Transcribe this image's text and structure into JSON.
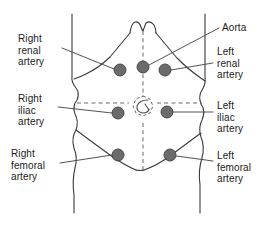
{
  "diagram": {
    "colors": {
      "outline": "#3a3a3a",
      "dot_fill": "#6b6b6b",
      "dot_stroke": "#3f3f3f",
      "leader_line": "#4a4a4a",
      "dashed_guide": "#6a6a6a",
      "text": "#1a1a1a",
      "background": "#ffffff"
    },
    "labels": [
      {
        "id": "right-renal-artery",
        "text": "Right\nrenal\nartery",
        "side": "left",
        "x": 18,
        "y": 33
      },
      {
        "id": "right-iliac-artery",
        "text": "Right\niliac\nartery",
        "side": "left",
        "x": 18,
        "y": 93
      },
      {
        "id": "right-femoral-artery",
        "text": "Right\nfemoral\nartery",
        "side": "left",
        "x": 11,
        "y": 148
      },
      {
        "id": "aorta",
        "text": "Aorta",
        "side": "right",
        "x": 222,
        "y": 22
      },
      {
        "id": "left-renal-artery",
        "text": "Left\nrenal\nartery",
        "side": "right",
        "x": 217,
        "y": 46
      },
      {
        "id": "left-iliac-artery",
        "text": "Left\niliac\nartery",
        "side": "right",
        "x": 217,
        "y": 100
      },
      {
        "id": "left-femoral-artery",
        "text": "Left\nfemoral\nartery",
        "side": "right",
        "x": 217,
        "y": 150
      }
    ],
    "pulse_points": [
      {
        "id": "right-renal-point",
        "x": 120,
        "y": 70,
        "r": 6
      },
      {
        "id": "aorta-point",
        "x": 143,
        "y": 67,
        "r": 6
      },
      {
        "id": "left-renal-point",
        "x": 165,
        "y": 70,
        "r": 6
      },
      {
        "id": "right-iliac-point",
        "x": 118,
        "y": 113,
        "r": 6
      },
      {
        "id": "left-iliac-point",
        "x": 167,
        "y": 112,
        "r": 6
      },
      {
        "id": "right-femoral-point",
        "x": 118,
        "y": 155,
        "r": 6
      },
      {
        "id": "left-femoral-point",
        "x": 170,
        "y": 155,
        "r": 6
      }
    ]
  }
}
